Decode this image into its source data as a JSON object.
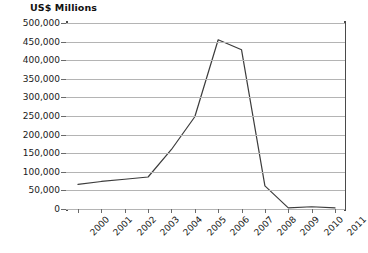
{
  "chart_data": {
    "type": "line",
    "title": "US$ Millions",
    "xlabel": "",
    "ylabel": "US$ Millions",
    "categories": [
      "2000",
      "2001",
      "2002",
      "2003",
      "2004",
      "2005",
      "2006",
      "2007",
      "2008",
      "2009",
      "2010",
      "2011"
    ],
    "values": [
      66000,
      74000,
      80000,
      86000,
      160000,
      248000,
      455000,
      428000,
      62000,
      3000,
      6000,
      3000
    ],
    "series": [
      {
        "name": "US$ Millions",
        "values": [
          66000,
          74000,
          80000,
          86000,
          160000,
          248000,
          455000,
          428000,
          62000,
          3000,
          6000,
          3000
        ]
      }
    ],
    "ylim": [
      0,
      500000
    ],
    "ytick_values": [
      0,
      50000,
      100000,
      150000,
      200000,
      250000,
      300000,
      350000,
      400000,
      450000,
      500000
    ],
    "ytick_labels": [
      "0",
      "50,000",
      "100,000",
      "150,000",
      "200,000",
      "250,000",
      "300,000",
      "350,000",
      "400,000",
      "450,000",
      "500,000"
    ],
    "grid": true,
    "legend": "none",
    "line_color": "#3c3c3c",
    "gridline_color": "#b4b4b4",
    "axis_color": "#4a4a4a",
    "background_color": "#ffffff"
  }
}
